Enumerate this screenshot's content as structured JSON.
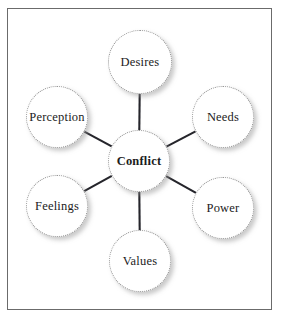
{
  "diagram": {
    "title": "Conflict",
    "type": "hub-and-spoke",
    "frame": {
      "border_color": "#6b6b6b"
    },
    "center": {
      "id": "conflict",
      "label": "Conflict",
      "cx": 139,
      "cy": 161,
      "r": 31,
      "bold": true
    },
    "satellites": [
      {
        "id": "desires",
        "label": "Desires",
        "cx": 140,
        "cy": 62,
        "r": 32
      },
      {
        "id": "needs",
        "label": "Needs",
        "cx": 223,
        "cy": 117,
        "r": 31
      },
      {
        "id": "power",
        "label": "Power",
        "cx": 223,
        "cy": 208,
        "r": 31
      },
      {
        "id": "values",
        "label": "Values",
        "cx": 140,
        "cy": 261,
        "r": 31
      },
      {
        "id": "feelings",
        "label": "Feelings",
        "cx": 57,
        "cy": 206,
        "r": 31
      },
      {
        "id": "perception",
        "label": "Perception",
        "cx": 57,
        "cy": 117,
        "r": 31
      }
    ],
    "edges": [
      {
        "from": "conflict",
        "to": "desires"
      },
      {
        "from": "conflict",
        "to": "needs"
      },
      {
        "from": "conflict",
        "to": "power"
      },
      {
        "from": "conflict",
        "to": "values"
      },
      {
        "from": "conflict",
        "to": "feelings"
      },
      {
        "from": "conflict",
        "to": "perception"
      }
    ],
    "style": {
      "edge_color": "#25252b",
      "edge_width": 2.1,
      "node_border_color": "#8f8f8f",
      "node_fill": "#ffffff",
      "label_color": "#1c1c1c"
    }
  }
}
